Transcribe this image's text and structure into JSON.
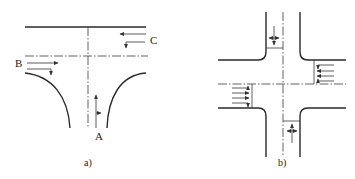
{
  "figure": {
    "panels": [
      {
        "id": "a",
        "caption": "a)",
        "type": "T-intersection",
        "approach_labels": {
          "A": "A",
          "B": "B",
          "C": "C"
        },
        "approaches": [
          {
            "label": "A",
            "position": "bottom",
            "movements": [
              "through",
              "right"
            ]
          },
          {
            "label": "B",
            "position": "left",
            "movements": [
              "through",
              "right"
            ]
          },
          {
            "label": "C",
            "position": "right",
            "movements": [
              "through",
              "left"
            ]
          }
        ]
      },
      {
        "id": "b",
        "caption": "b)",
        "type": "four-leg intersection",
        "approaches": [
          {
            "position": "top",
            "movements": [
              "through",
              "left",
              "right"
            ]
          },
          {
            "position": "right",
            "movements": [
              "left",
              "through",
              "through",
              "right"
            ]
          },
          {
            "position": "left",
            "movements": [
              "left",
              "through",
              "through",
              "right"
            ]
          },
          {
            "position": "bottom",
            "movements": [
              "through",
              "left",
              "right"
            ]
          }
        ]
      }
    ]
  }
}
